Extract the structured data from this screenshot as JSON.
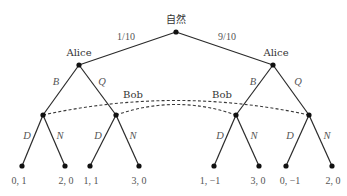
{
  "nodes": {
    "root": {
      "label": "自然"
    },
    "alice_left": {
      "label": "Alice"
    },
    "alice_right": {
      "label": "Alice"
    },
    "bob_labels": [
      "Bob",
      "Bob"
    ]
  },
  "chance": {
    "left_prob": "1/10",
    "right_prob": "9/10"
  },
  "actions": {
    "alice": [
      "B",
      "Q"
    ],
    "bob": [
      "D",
      "N"
    ]
  },
  "payoffs": [
    "0, 1",
    "2, 0",
    "1, 1",
    "3, 0",
    "1, −1",
    "3, 0",
    "0, −1",
    "2, 0"
  ],
  "information_sets": [
    {
      "player": "Bob",
      "connects": [
        "left-B",
        "right-Q"
      ]
    },
    {
      "player": "Bob",
      "connects": [
        "left-Q",
        "right-B"
      ]
    }
  ]
}
